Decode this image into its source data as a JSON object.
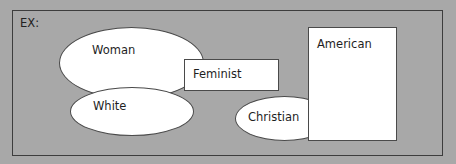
{
  "diagram": {
    "title": "EX:",
    "background_color": "#a8a8a8",
    "shape_fill": "#ffffff",
    "shapes": [
      {
        "id": "woman",
        "type": "ellipse",
        "label": "Woman"
      },
      {
        "id": "white",
        "type": "ellipse",
        "label": "White"
      },
      {
        "id": "feminist",
        "type": "rectangle",
        "label": "Feminist"
      },
      {
        "id": "christian",
        "type": "ellipse",
        "label": "Christian"
      },
      {
        "id": "american",
        "type": "rectangle",
        "label": "American"
      }
    ]
  }
}
